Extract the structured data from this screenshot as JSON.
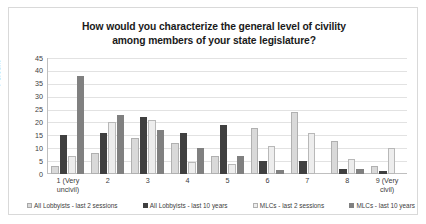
{
  "chart_data": {
    "type": "bar",
    "title": "How would you characterize the general level of civility among members of your state legislature?",
    "title_line1": "How would you characterize the general level of civility",
    "title_line2": "among members of your state legislature?",
    "xlabel": "",
    "ylabel": "Percent",
    "ylim": [
      0,
      45
    ],
    "ytick_labels": [
      "45",
      "40",
      "35",
      "30",
      "25",
      "20",
      "15",
      "10",
      "5",
      "0"
    ],
    "ytick_values": [
      45,
      40,
      35,
      30,
      25,
      20,
      15,
      10,
      5,
      0
    ],
    "grid": true,
    "legend_position": "bottom",
    "categories": [
      "1 (Very uncivil)",
      "2",
      "3",
      "4",
      "5",
      "6",
      "7",
      "8",
      "9 (Very civil)"
    ],
    "category_lines": [
      [
        "1 (Very",
        "uncivil)"
      ],
      [
        "2",
        ""
      ],
      [
        "3",
        ""
      ],
      [
        "4",
        ""
      ],
      [
        "5",
        ""
      ],
      [
        "6",
        ""
      ],
      [
        "7",
        ""
      ],
      [
        "8",
        ""
      ],
      [
        "9 (Very",
        "civil)"
      ]
    ],
    "series": [
      {
        "name": "All Lobbyists - last 2 sessions",
        "color": "#d9d9d9",
        "values": [
          3,
          8,
          14,
          12,
          7,
          18,
          24,
          13,
          3
        ]
      },
      {
        "name": "All Lobbyists - last 10 years",
        "color": "#404040",
        "values": [
          15,
          16,
          22,
          16,
          19,
          5,
          5,
          2,
          1
        ]
      },
      {
        "name": "MLCs - last 2 sessions",
        "color": "#ededed",
        "values": [
          7,
          20,
          21,
          4.5,
          4,
          11,
          16,
          6,
          10
        ]
      },
      {
        "name": "MLCs - last 10 years",
        "color": "#808080",
        "values": [
          38,
          23,
          17,
          10,
          7,
          1.5,
          0,
          2,
          0
        ]
      }
    ]
  }
}
